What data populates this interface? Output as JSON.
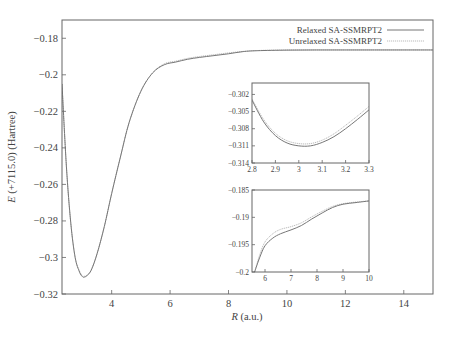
{
  "chart_data": [
    {
      "id": "main",
      "type": "line",
      "title": "",
      "xlabel": "R (a.u.)",
      "xlabel_italic": "R",
      "xlabel_rest": " (a.u.)",
      "ylabel": "E (+7115.0) (Hartree)",
      "ylabel_italic": "E",
      "ylabel_rest": " (+7115.0) (Hartree)",
      "xlim": [
        2.3,
        15.0
      ],
      "ylim": [
        -0.32,
        -0.17
      ],
      "xticks": [
        4,
        6,
        8,
        10,
        12,
        14
      ],
      "yticks": [
        -0.18,
        -0.2,
        -0.22,
        -0.24,
        -0.26,
        -0.28,
        -0.3,
        -0.32
      ],
      "ytick_labels": [
        "−0.18",
        "−0.2",
        "−0.22",
        "−0.24",
        "−0.26",
        "−0.28",
        "−0.3",
        "−0.32"
      ],
      "xtick_labels": [
        "4",
        "6",
        "8",
        "10",
        "12",
        "14"
      ],
      "grid": false,
      "legend_position": "upper right",
      "series": [
        {
          "name": "Relaxed SA-SSMRPT2",
          "style": "solid",
          "x": [
            2.3,
            2.45,
            2.6,
            2.75,
            2.9,
            3.0,
            3.05,
            3.15,
            3.3,
            3.5,
            3.75,
            4.0,
            4.3,
            4.6,
            5.0,
            5.4,
            5.8,
            6.2,
            6.6,
            7.0,
            7.5,
            8.0,
            8.5,
            9.0,
            10.0,
            11.0,
            12.0,
            13.0,
            14.0,
            15.0
          ],
          "y": [
            -0.205,
            -0.25,
            -0.281,
            -0.3,
            -0.308,
            -0.3105,
            -0.3108,
            -0.31,
            -0.307,
            -0.298,
            -0.283,
            -0.265,
            -0.245,
            -0.226,
            -0.209,
            -0.199,
            -0.1945,
            -0.193,
            -0.1915,
            -0.1905,
            -0.1895,
            -0.1885,
            -0.1873,
            -0.1868,
            -0.1865,
            -0.1864,
            -0.1864,
            -0.1864,
            -0.1864,
            -0.1864
          ]
        },
        {
          "name": "Unrelaxed SA-SSMRPT2",
          "style": "dotted",
          "x": [
            2.3,
            2.45,
            2.6,
            2.75,
            2.9,
            3.0,
            3.05,
            3.15,
            3.3,
            3.5,
            3.75,
            4.0,
            4.3,
            4.6,
            5.0,
            5.4,
            5.8,
            6.2,
            6.6,
            7.0,
            7.5,
            8.0,
            8.5,
            9.0,
            10.0,
            11.0,
            12.0,
            13.0,
            14.0,
            15.0
          ],
          "y": [
            -0.205,
            -0.25,
            -0.281,
            -0.3,
            -0.3075,
            -0.31,
            -0.3103,
            -0.3097,
            -0.3067,
            -0.298,
            -0.283,
            -0.265,
            -0.245,
            -0.226,
            -0.209,
            -0.199,
            -0.194,
            -0.1925,
            -0.191,
            -0.19,
            -0.189,
            -0.188,
            -0.1872,
            -0.1867,
            -0.1864,
            -0.1864,
            -0.1864,
            -0.1864,
            -0.1864,
            -0.1864
          ]
        }
      ]
    },
    {
      "id": "inset_min",
      "type": "line",
      "title": "",
      "xlabel": "",
      "ylabel": "",
      "xlim": [
        2.8,
        3.3
      ],
      "ylim": [
        -0.314,
        -0.3
      ],
      "xticks": [
        2.8,
        2.9,
        3.0,
        3.1,
        3.2,
        3.3
      ],
      "xtick_labels": [
        "2.8",
        "2.9",
        "3",
        "3.1",
        "3.2",
        "3.3"
      ],
      "yticks": [
        -0.302,
        -0.305,
        -0.308,
        -0.311,
        -0.314
      ],
      "ytick_labels": [
        "−0.302",
        "−0.305",
        "−0.308",
        "−0.311",
        "−0.314"
      ],
      "series": [
        {
          "name": "Relaxed SA-SSMRPT2",
          "style": "solid",
          "x": [
            2.8,
            2.85,
            2.9,
            2.95,
            3.0,
            3.05,
            3.1,
            3.15,
            3.2,
            3.25,
            3.3
          ],
          "y": [
            -0.303,
            -0.3068,
            -0.3092,
            -0.3105,
            -0.311,
            -0.311,
            -0.3104,
            -0.3094,
            -0.308,
            -0.3064,
            -0.3047
          ]
        },
        {
          "name": "Unrelaxed SA-SSMRPT2",
          "style": "dotted",
          "x": [
            2.8,
            2.85,
            2.9,
            2.95,
            3.0,
            3.05,
            3.1,
            3.15,
            3.2,
            3.25,
            3.3
          ],
          "y": [
            -0.3028,
            -0.3064,
            -0.3088,
            -0.3101,
            -0.3106,
            -0.3106,
            -0.31,
            -0.3089,
            -0.3074,
            -0.3058,
            -0.3041
          ]
        }
      ]
    },
    {
      "id": "inset_tail",
      "type": "line",
      "title": "",
      "xlabel": "",
      "ylabel": "",
      "xlim": [
        5.5,
        10.0
      ],
      "ylim": [
        -0.2,
        -0.185
      ],
      "xticks": [
        6,
        7,
        8,
        9,
        10
      ],
      "xtick_labels": [
        "6",
        "7",
        "8",
        "9",
        "10"
      ],
      "yticks": [
        -0.185,
        -0.19,
        -0.195,
        -0.2
      ],
      "ytick_labels": [
        "−0.185",
        "−0.19",
        "−0.195",
        "−0.2"
      ],
      "series": [
        {
          "name": "Relaxed SA-SSMRPT2",
          "style": "solid",
          "x": [
            5.6,
            5.8,
            6.0,
            6.3,
            6.6,
            7.0,
            7.4,
            7.8,
            8.2,
            8.6,
            9.0,
            9.5,
            10.0
          ],
          "y": [
            -0.2,
            -0.1973,
            -0.1952,
            -0.1938,
            -0.193,
            -0.1923,
            -0.1915,
            -0.1903,
            -0.1892,
            -0.1882,
            -0.1876,
            -0.1873,
            -0.187
          ]
        },
        {
          "name": "Unrelaxed SA-SSMRPT2",
          "style": "dotted",
          "x": [
            5.6,
            5.8,
            6.0,
            6.3,
            6.6,
            7.0,
            7.4,
            7.8,
            8.2,
            8.6,
            9.0,
            9.5,
            10.0
          ],
          "y": [
            -0.2,
            -0.1968,
            -0.1945,
            -0.193,
            -0.1922,
            -0.1917,
            -0.191,
            -0.1899,
            -0.1889,
            -0.188,
            -0.1875,
            -0.1872,
            -0.187
          ]
        }
      ]
    }
  ],
  "legend": {
    "entries": [
      {
        "label": "Relaxed SA-SSMRPT2",
        "style": "solid"
      },
      {
        "label": "Unrelaxed SA-SSMRPT2",
        "style": "dotted"
      }
    ]
  },
  "layout": {
    "main_frame": {
      "left": 62,
      "top": 20,
      "right": 433,
      "bottom": 294
    },
    "inset_min_frame": {
      "left": 252,
      "top": 83,
      "right": 369,
      "bottom": 163
    },
    "inset_tail_frame": {
      "left": 252,
      "top": 190,
      "right": 369,
      "bottom": 272
    },
    "colors": {
      "relaxed": "#777777",
      "unrelaxed": "#bbbbbb",
      "frame": "#666666",
      "text": "#444444"
    }
  }
}
